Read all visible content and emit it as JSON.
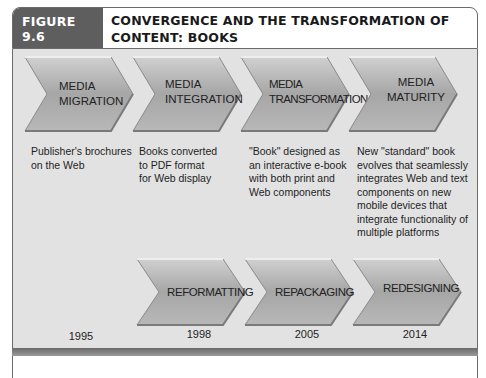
{
  "figure": {
    "label": "FIGURE 9.6",
    "title": "CONVERGENCE AND THE TRANSFORMATION OF CONTENT: BOOKS"
  },
  "colors": {
    "label_bg": "#5e5e5e",
    "panel_bg": "#e2e2e2",
    "chevron_fill": "#a8a8a8",
    "border": "#6b6b6b"
  },
  "stages": [
    {
      "line1": "MEDIA",
      "line2": "MIGRATION",
      "description": "Publisher's brochures on the Web"
    },
    {
      "line1": "MEDIA",
      "line2": "INTEGRATION",
      "description": "Books converted to PDF format for Web display"
    },
    {
      "line1": "MEDIA",
      "line2": "TRANSFORMATION",
      "description": "\"Book\" designed as an interactive e-book with both print and Web components"
    },
    {
      "line1": "MEDIA",
      "line2": "MATURITY",
      "description": "New \"standard\" book evolves that seamlessly integrates Web and text components on new mobile devices that integrate functionality of multiple platforms"
    }
  ],
  "processes": [
    {
      "label": "REFORMATTING"
    },
    {
      "label": "REPACKAGING"
    },
    {
      "label": "REDESIGNING"
    }
  ],
  "years": [
    "1995",
    "1998",
    "2005",
    "2014"
  ]
}
